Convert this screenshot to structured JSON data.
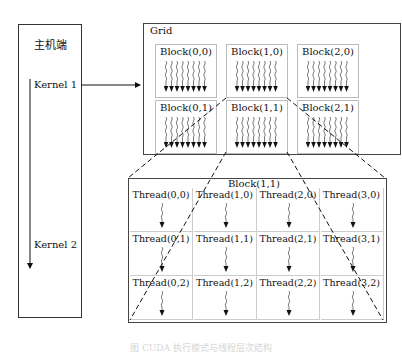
{
  "host": {
    "title": "主机端",
    "kernels": [
      "Kernel 1",
      "Kernel 2"
    ]
  },
  "grid": {
    "title": "Grid",
    "blocks": [
      {
        "label": "Block(0,0)"
      },
      {
        "label": "Block(1,0)"
      },
      {
        "label": "Block(2,0)"
      },
      {
        "label": "Block(0,1)"
      },
      {
        "label": "Block(1,1)"
      },
      {
        "label": "Block(2,1)"
      }
    ]
  },
  "detail": {
    "title": "Block(1,1)",
    "threads": [
      [
        "Thread(0,0)",
        "Thread(1,0)",
        "Thread(2,0)",
        "Thread(3,0)"
      ],
      [
        "Thread(0,1)",
        "Thread(1,1)",
        "Thread(2,1)",
        "Thread(3,1)"
      ],
      [
        "Thread(0,2)",
        "Thread(1,2)",
        "Thread(2,2)",
        "Thread(3,2)"
      ]
    ]
  },
  "caption": "图 CUDA 执行模式与线程层次结构"
}
